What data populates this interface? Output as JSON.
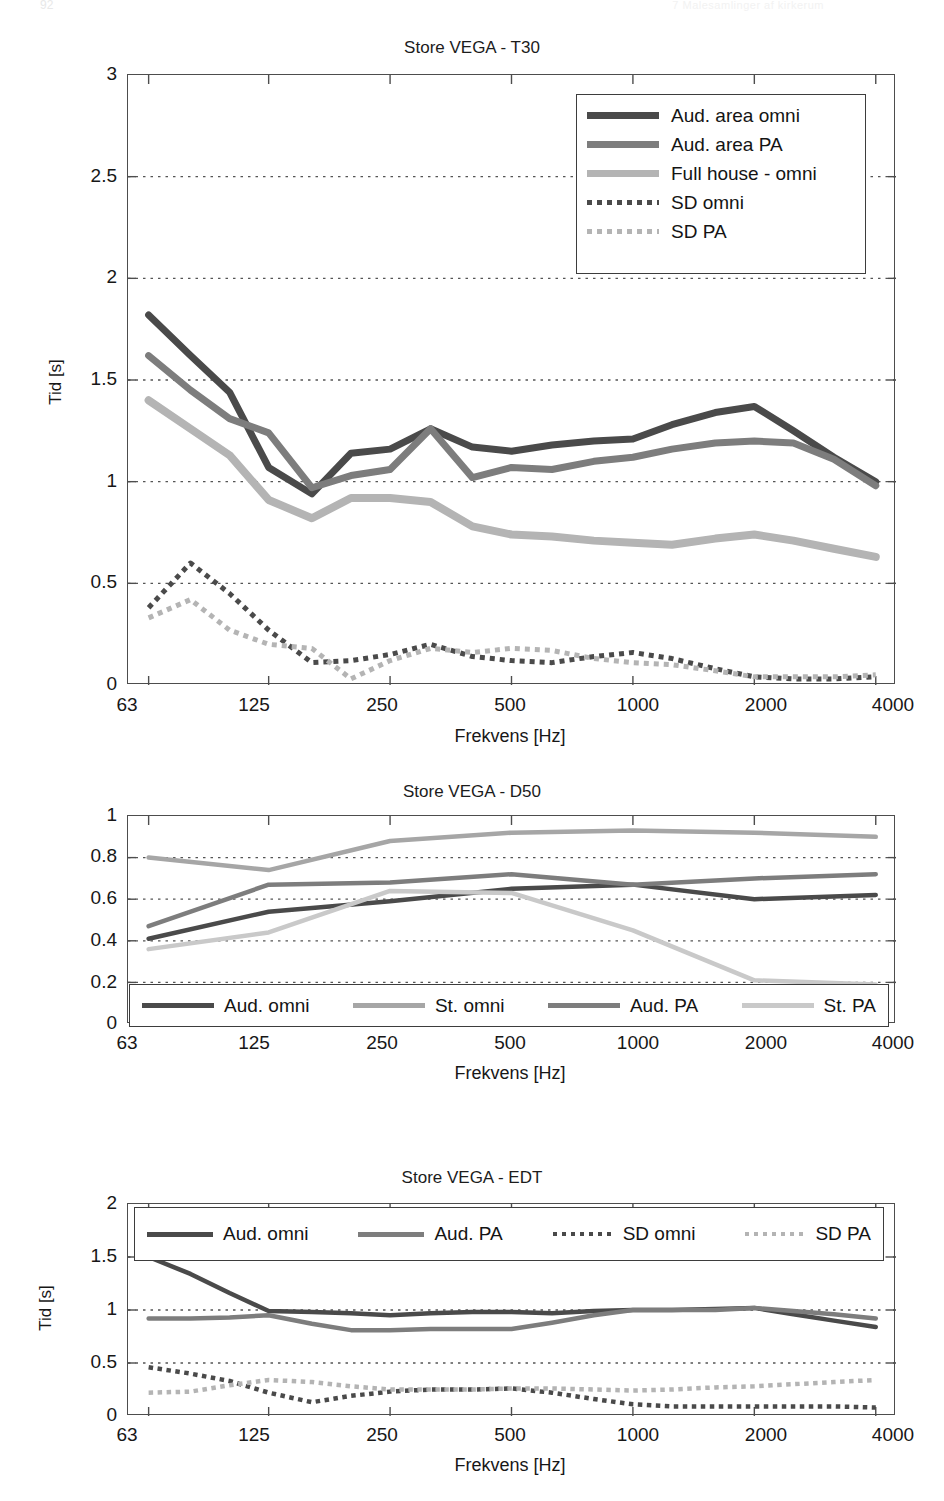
{
  "page_header": {
    "left": "92",
    "right": "7  Malesamlinger af kirkerum"
  },
  "axis": {
    "xlabel": "Frekvens [Hz]",
    "ylabel_time": "Tid [s]",
    "xticks": [
      "63",
      "125",
      "250",
      "500",
      "1000",
      "2000",
      "4000"
    ]
  },
  "colors": {
    "dark": "#4a4a4a",
    "medium": "#7d7d7d",
    "light": "#b4b4b4",
    "axis": "#4d4d4d",
    "grid": "#5a5a5a"
  },
  "charts": [
    {
      "id": "t30",
      "title": "Store VEGA - T30",
      "yticks": [
        "0",
        "0.5",
        "1",
        "1.5",
        "2",
        "2.5",
        "3"
      ],
      "ylabel": "Tid [s]",
      "legend_position": "top-right",
      "legend": [
        {
          "label": "Aud. area omni",
          "style": "solid",
          "color": "dark",
          "width": 5
        },
        {
          "label": "Aud. area PA",
          "style": "solid",
          "color": "medium",
          "width": 5
        },
        {
          "label": "Full house - omni",
          "style": "solid",
          "color": "light",
          "width": 5
        },
        {
          "label": "SD omni",
          "style": "dotted",
          "color": "dark",
          "width": 4
        },
        {
          "label": "SD PA",
          "style": "dotted",
          "color": "light",
          "width": 4
        }
      ]
    },
    {
      "id": "d50",
      "title": "Store VEGA - D50",
      "yticks": [
        "0",
        "0.2",
        "0.4",
        "0.6",
        "0.8",
        "1"
      ],
      "ylabel": "",
      "legend_position": "bottom-inside",
      "legend": [
        {
          "label": "Aud. omni",
          "style": "solid",
          "color": "dark",
          "width": 4
        },
        {
          "label": "St. omni",
          "style": "solid",
          "color": "light",
          "width": 4
        },
        {
          "label": "Aud. PA",
          "style": "solid",
          "color": "medium",
          "width": 4
        },
        {
          "label": "St. PA",
          "style": "solid",
          "color": "lighter",
          "width": 4
        }
      ]
    },
    {
      "id": "edt",
      "title": "Store VEGA - EDT",
      "yticks": [
        "0",
        "0.5",
        "1",
        "1.5",
        "2"
      ],
      "ylabel": "Tid [s]",
      "legend_position": "top-inside",
      "legend": [
        {
          "label": "Aud. omni",
          "style": "solid",
          "color": "dark",
          "width": 4
        },
        {
          "label": "Aud. PA",
          "style": "solid",
          "color": "medium",
          "width": 4
        },
        {
          "label": "SD omni",
          "style": "dotted",
          "color": "dark",
          "width": 3
        },
        {
          "label": "SD PA",
          "style": "dotted",
          "color": "light",
          "width": 3
        }
      ]
    }
  ],
  "chart_data": [
    {
      "type": "line",
      "title": "Store VEGA - T30",
      "xlabel": "Frekvens [Hz]",
      "ylabel": "Tid [s]",
      "xscale": "log",
      "xticks": [
        63,
        125,
        250,
        500,
        1000,
        2000,
        4000
      ],
      "xlim": [
        56,
        4490
      ],
      "ylim": [
        0,
        3
      ],
      "yticks": [
        0,
        0.5,
        1,
        1.5,
        2,
        2.5,
        3
      ],
      "grid": "horizontal-dotted",
      "legend_position": "top right",
      "x": [
        63,
        80,
        100,
        125,
        160,
        200,
        250,
        315,
        400,
        500,
        630,
        800,
        1000,
        1250,
        1600,
        2000,
        2500,
        3150,
        4000
      ],
      "series": [
        {
          "name": "Aud. area omni",
          "values": [
            1.82,
            1.62,
            1.44,
            1.07,
            0.94,
            1.14,
            1.16,
            1.26,
            1.17,
            1.15,
            1.18,
            1.2,
            1.21,
            1.28,
            1.34,
            1.37,
            1.25,
            1.12,
            1.0
          ]
        },
        {
          "name": "Aud. area PA",
          "values": [
            1.62,
            1.45,
            1.31,
            1.24,
            0.97,
            1.03,
            1.06,
            1.26,
            1.02,
            1.07,
            1.06,
            1.1,
            1.12,
            1.16,
            1.19,
            1.2,
            1.19,
            1.11,
            0.98
          ]
        },
        {
          "name": "Full house - omni",
          "values": [
            1.4,
            1.26,
            1.13,
            0.91,
            0.82,
            0.92,
            0.92,
            0.9,
            0.78,
            0.74,
            0.73,
            0.71,
            0.7,
            0.69,
            0.72,
            0.74,
            0.71,
            0.67,
            0.63
          ]
        },
        {
          "name": "SD omni",
          "values": [
            0.38,
            0.6,
            0.45,
            0.27,
            0.11,
            0.12,
            0.15,
            0.2,
            0.14,
            0.12,
            0.11,
            0.14,
            0.16,
            0.13,
            0.08,
            0.04,
            0.03,
            0.03,
            0.04
          ]
        },
        {
          "name": "SD PA",
          "values": [
            0.33,
            0.42,
            0.27,
            0.2,
            0.18,
            0.03,
            0.12,
            0.18,
            0.16,
            0.18,
            0.17,
            0.13,
            0.11,
            0.1,
            0.07,
            0.04,
            0.04,
            0.04,
            0.05
          ]
        }
      ]
    },
    {
      "type": "line",
      "title": "Store VEGA - D50",
      "xlabel": "Frekvens [Hz]",
      "ylabel": "",
      "xscale": "log",
      "xticks": [
        63,
        125,
        250,
        500,
        1000,
        2000,
        4000
      ],
      "xlim": [
        56,
        4490
      ],
      "ylim": [
        0,
        1
      ],
      "yticks": [
        0,
        0.2,
        0.4,
        0.6,
        0.8,
        1
      ],
      "grid": "horizontal-dotted",
      "legend_position": "bottom inside",
      "x": [
        63,
        125,
        250,
        500,
        1000,
        2000,
        4000
      ],
      "series": [
        {
          "name": "Aud. omni",
          "values": [
            0.41,
            0.54,
            0.59,
            0.65,
            0.67,
            0.6,
            0.62
          ]
        },
        {
          "name": "St. omni",
          "values": [
            0.8,
            0.74,
            0.88,
            0.92,
            0.93,
            0.92,
            0.9
          ]
        },
        {
          "name": "Aud. PA",
          "values": [
            0.47,
            0.67,
            0.68,
            0.72,
            0.67,
            0.7,
            0.72
          ]
        },
        {
          "name": "St. PA",
          "values": [
            0.36,
            0.44,
            0.64,
            0.63,
            0.45,
            0.21,
            0.19
          ]
        }
      ]
    },
    {
      "type": "line",
      "title": "Store VEGA - EDT",
      "xlabel": "Frekvens [Hz]",
      "ylabel": "Tid [s]",
      "xscale": "log",
      "xticks": [
        63,
        125,
        250,
        500,
        1000,
        2000,
        4000
      ],
      "xlim": [
        56,
        4490
      ],
      "ylim": [
        0,
        2
      ],
      "yticks": [
        0,
        0.5,
        1,
        1.5,
        2
      ],
      "grid": "horizontal-dotted",
      "legend_position": "top inside",
      "x": [
        63,
        80,
        100,
        125,
        160,
        200,
        250,
        315,
        400,
        500,
        630,
        800,
        1000,
        1250,
        1600,
        2000,
        2500,
        3150,
        4000
      ],
      "series": [
        {
          "name": "Aud. omni",
          "values": [
            1.5,
            1.34,
            1.16,
            0.99,
            0.98,
            0.97,
            0.95,
            0.97,
            0.98,
            0.98,
            0.97,
            0.99,
            1.0,
            1.0,
            1.01,
            1.02,
            0.96,
            0.9,
            0.84
          ]
        },
        {
          "name": "Aud. PA",
          "values": [
            0.92,
            0.92,
            0.93,
            0.95,
            0.87,
            0.81,
            0.81,
            0.82,
            0.82,
            0.82,
            0.88,
            0.95,
            1.0,
            1.0,
            1.0,
            1.02,
            0.99,
            0.96,
            0.92
          ]
        },
        {
          "name": "SD omni",
          "values": [
            0.46,
            0.4,
            0.33,
            0.22,
            0.13,
            0.19,
            0.23,
            0.25,
            0.25,
            0.26,
            0.22,
            0.16,
            0.11,
            0.09,
            0.09,
            0.09,
            0.09,
            0.09,
            0.08
          ]
        },
        {
          "name": "SD PA",
          "values": [
            0.22,
            0.23,
            0.29,
            0.34,
            0.32,
            0.28,
            0.25,
            0.25,
            0.25,
            0.26,
            0.26,
            0.25,
            0.24,
            0.25,
            0.27,
            0.28,
            0.3,
            0.32,
            0.34
          ]
        }
      ]
    }
  ]
}
